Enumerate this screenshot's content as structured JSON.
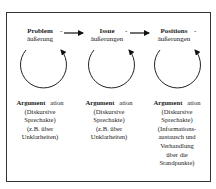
{
  "columns": [
    {
      "head_bold": "Problem",
      "head_sub": "äußerung",
      "head_dash": "-",
      "caption_bold": "Argument",
      "caption_suffix": "ation",
      "caption_lines": [
        "(Diskursive",
        "Sprechakte)",
        "(z.B. über",
        "Unklarheiten)"
      ]
    },
    {
      "head_bold": "Issue",
      "head_sub": "äußerungen",
      "head_dash": "-",
      "caption_bold": "Argument",
      "caption_suffix": "ation",
      "caption_lines": [
        "(Diskursive",
        "Sprechakte)",
        "(z.B. über",
        "Unklarheiten)"
      ]
    },
    {
      "head_bold": "Positions",
      "head_sub": "äußerungen",
      "head_dash": "-",
      "caption_bold": "Argument",
      "caption_suffix": "ation",
      "caption_lines": [
        "(Diskursive",
        "Sprechakte)",
        "(Informations-",
        "austausch und",
        "Verhandlung",
        "über die",
        "Standpunkte)"
      ]
    }
  ]
}
